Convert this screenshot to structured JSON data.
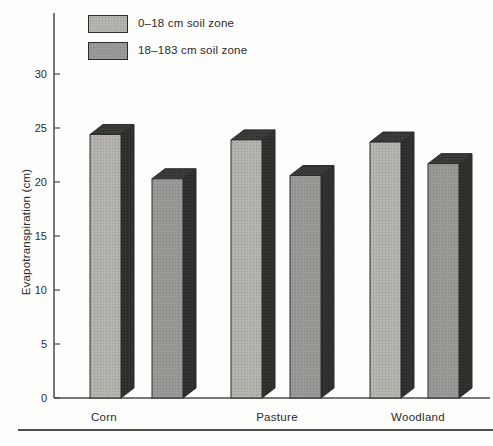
{
  "figure": {
    "background": "#fdfdfc",
    "bottom_rule": true
  },
  "legend": {
    "position": "top-left",
    "items": [
      {
        "label": "0–18 cm soil zone",
        "color": "#b5b3ae"
      },
      {
        "label": "18–183 cm soil zone",
        "color": "#9b9995"
      }
    ]
  },
  "chart_data": {
    "type": "bar",
    "style": "3d-block",
    "title": "",
    "xlabel": "",
    "ylabel": "Evapotranspiration (cm)",
    "categories": [
      "Corn",
      "Pasture",
      "Woodland"
    ],
    "series": [
      {
        "name": "0–18 cm soil zone",
        "color": "#b5b3ae",
        "values": [
          24.4,
          23.9,
          23.7
        ]
      },
      {
        "name": "18–183 cm soil zone",
        "color": "#9b9995",
        "values": [
          20.3,
          20.6,
          21.7
        ]
      }
    ],
    "ylim": [
      0,
      33.5
    ],
    "yticks": [
      0,
      5,
      10,
      15,
      20,
      25,
      30
    ],
    "grid": false,
    "legend_position": "top-left",
    "colors": {
      "bar_side_face": "#31312e",
      "bar_top_face": "#3b3b38",
      "bar_outline": "#2b2b2b",
      "axis": "#4a4a4a",
      "text": "#2b2b2b"
    }
  }
}
